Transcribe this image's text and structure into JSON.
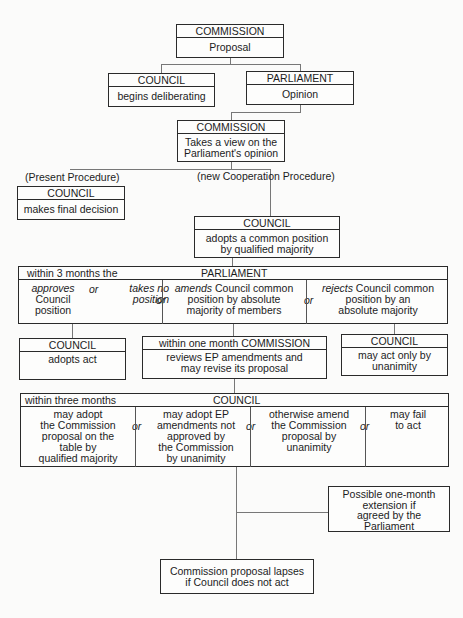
{
  "diagram": {
    "commission_proposal": {
      "header": "COMMISSION",
      "body": "Proposal"
    },
    "council_deliberating": {
      "header": "COUNCIL",
      "body": "begins deliberating"
    },
    "parliament_opinion": {
      "header": "PARLIAMENT",
      "body": "Opinion"
    },
    "commission_view": {
      "header": "COMMISSION",
      "body_lines": [
        "Takes a view on the",
        "Parliament's opinion"
      ]
    },
    "present_procedure_label": "(Present Procedure)",
    "new_procedure_label": "(new Cooperation Procedure)",
    "council_final": {
      "header": "COUNCIL",
      "body": "makes final decision"
    },
    "council_common": {
      "header": "COUNCIL",
      "body_lines": [
        "adopts a common position",
        "by qualified majority"
      ]
    },
    "parliament_3months": {
      "prefix": "within 3 months the",
      "header": "PARLIAMENT",
      "options": [
        {
          "italic": "approves",
          "rest_lines": [
            "Council",
            "position"
          ]
        },
        {
          "italic_lines": [
            "takes no",
            "position"
          ]
        },
        {
          "italic": "amends",
          "rest_lines": [
            "Council common",
            "position by absolute",
            "majority of members"
          ]
        },
        {
          "italic": "rejects",
          "rest_lines": [
            "Council common",
            "position by an",
            "absolute majority"
          ]
        }
      ],
      "or": "or"
    },
    "council_adopts": {
      "header": "COUNCIL",
      "body": "adopts act"
    },
    "commission_month": {
      "header": "within one month COMMISSION",
      "body_lines": [
        "reviews EP amendments and",
        "may revise its proposal"
      ]
    },
    "council_unanimity": {
      "header": "COUNCIL",
      "body_lines": [
        "may act only by",
        "unanimity"
      ]
    },
    "council_3months": {
      "prefix": "within three months",
      "header": "COUNCIL",
      "options": [
        {
          "lines": [
            "may adopt",
            "the Commission",
            "proposal on the",
            "table by",
            "qualified majority"
          ]
        },
        {
          "lines": [
            "may adopt EP",
            "amendments not",
            "approved by",
            "the Commission",
            "by unanimity"
          ]
        },
        {
          "lines": [
            "otherwise amend",
            "the Commission",
            "proposal by",
            "unanimity"
          ]
        },
        {
          "lines": [
            "may fail",
            "to act"
          ]
        }
      ],
      "or": "or"
    },
    "extension": {
      "lines": [
        "Possible one-month",
        "extension if",
        "agreed by the",
        "Parliament"
      ]
    },
    "lapse": {
      "lines": [
        "Commission proposal lapses",
        "if Council does not act"
      ]
    }
  }
}
